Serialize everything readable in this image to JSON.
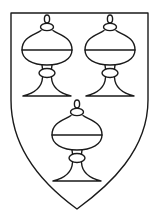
{
  "figure": {
    "title": "Shield with three covered cups",
    "colors": {
      "ink": "#1a1a1a",
      "field": "#ffffff"
    },
    "shield": {
      "top_left": [
        11,
        13
      ],
      "top_right": [
        148,
        13
      ],
      "point": [
        77,
        209
      ]
    },
    "charges": [
      {
        "name": "covered-cup",
        "position": "dexter-chief",
        "cx": 47
      },
      {
        "name": "covered-cup",
        "position": "sinister-chief",
        "cx": 110
      },
      {
        "name": "covered-cup",
        "position": "base",
        "cx": 77
      }
    ],
    "charge_count": "3"
  }
}
